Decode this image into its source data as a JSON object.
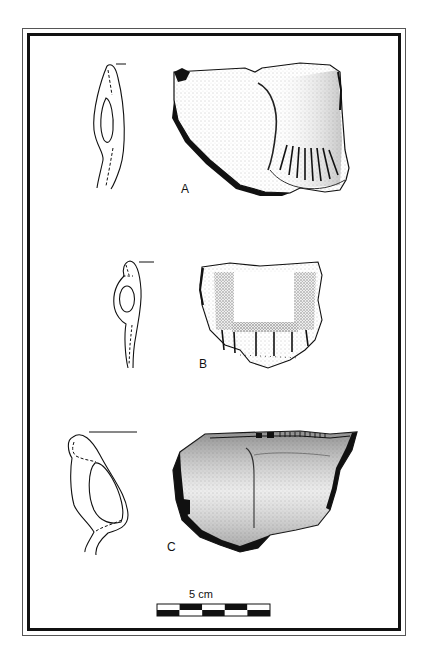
{
  "figure": {
    "specimens": [
      {
        "id": "A",
        "label": "A"
      },
      {
        "id": "B",
        "label": "B"
      },
      {
        "id": "C",
        "label": "C"
      }
    ],
    "scale_bar": {
      "label": "5 cm",
      "segments": 5
    },
    "colors": {
      "ink": "#111111",
      "paper": "#ffffff",
      "shade": "#d8d8d8"
    }
  }
}
